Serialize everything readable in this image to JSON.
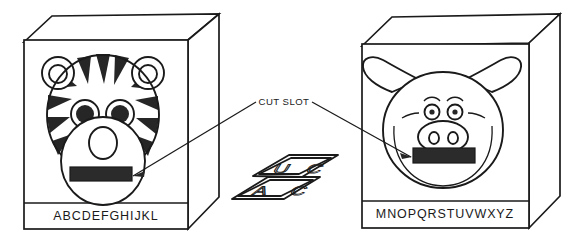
{
  "figure": {
    "type": "line-art-diagram",
    "background_color": "#ffffff",
    "line_color": "#1a1a1a",
    "fill_color": "#262626"
  },
  "callout": {
    "label": "CUT SLOT",
    "leader_targets": [
      "tiger-box-slot",
      "pig-box-slot"
    ]
  },
  "boxes": [
    {
      "id": "tiger-box",
      "animal": "tiger",
      "alphabet_label": "ABCDEFGHIJKL",
      "slot_label": "cut slot",
      "face_features": [
        "round-ears",
        "stripes",
        "eyes",
        "muzzle",
        "nose",
        "mouth-slot"
      ]
    },
    {
      "id": "pig-box",
      "animal": "pig",
      "alphabet_label": "MNOPQRSTUVWXYZ",
      "slot_label": "cut slot",
      "face_features": [
        "floppy-ears",
        "eyebrows",
        "eyes",
        "snout",
        "nostrils",
        "cheeks",
        "mouth-slot"
      ]
    }
  ],
  "cards": {
    "id": "letter-cards",
    "description": "loose alphabet cards lying flat",
    "letters": [
      "U",
      "A",
      "C"
    ]
  }
}
